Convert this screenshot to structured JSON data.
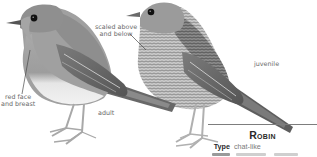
{
  "illustrations": {
    "adult": {
      "label": "adult"
    },
    "juvenile": {
      "label": "juvenile"
    }
  },
  "annotations": {
    "scaled": [
      "scaled above",
      "and below"
    ],
    "red_face": [
      "red face",
      "and breast"
    ]
  },
  "species": {
    "name": "Robin",
    "facts": [
      {
        "key": "Type",
        "value": "chat-like"
      }
    ]
  },
  "colors": {
    "rule": "#7d7d7d",
    "title": "#2a2a2a",
    "annotation": "#6a6a6a"
  }
}
